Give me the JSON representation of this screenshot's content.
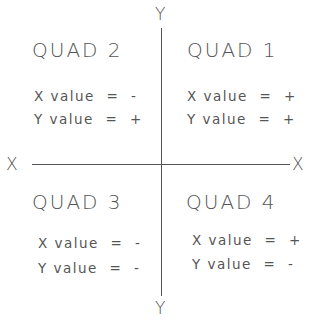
{
  "axes": {
    "x_label_left": "X",
    "x_label_right": "X",
    "y_label_top": "Y",
    "y_label_bottom": "Y",
    "line_color": "#555555"
  },
  "quadrants": {
    "q1": {
      "title": "QUAD 1",
      "x_line": "X value = +",
      "y_line": "Y value = +"
    },
    "q2": {
      "title": "QUAD 2",
      "x_line": "X value = -",
      "y_line": "Y value = +"
    },
    "q3": {
      "title": "QUAD 3",
      "x_line": "X value = -",
      "y_line": "Y value = -"
    },
    "q4": {
      "title": "QUAD 4",
      "x_line": "X value = +",
      "y_line": "Y value = -"
    }
  }
}
